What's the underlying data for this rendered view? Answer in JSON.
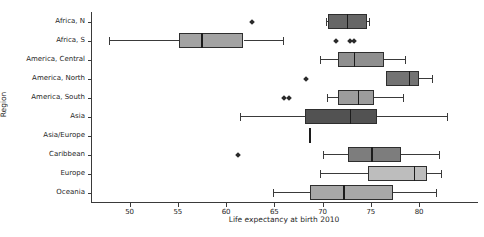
{
  "chart_data": {
    "type": "boxplot",
    "orientation": "horizontal",
    "title": "",
    "xlabel": "Life expectancy at birth 2010",
    "ylabel": "Region",
    "xlim": [
      46,
      86
    ],
    "x_ticks": [
      50,
      55,
      60,
      65,
      70,
      75,
      80
    ],
    "grid": false,
    "legend": "none",
    "categories": [
      "Africa, N",
      "Africa, S",
      "America, Central",
      "America, North",
      "America, South",
      "Asia",
      "Asia/Europe",
      "Caribbean",
      "Europe",
      "Oceania"
    ],
    "series": [
      {
        "name": "Africa, N",
        "whisker_lo": 70.2,
        "q1": 70.5,
        "median": 72.5,
        "q3": 74.5,
        "whisker_hi": 74.8,
        "fliers": [
          62.6
        ],
        "color": "#666666"
      },
      {
        "name": "Africa, S",
        "whisker_lo": 47.8,
        "q1": 55.0,
        "median": 57.4,
        "q3": 61.7,
        "whisker_hi": 65.9,
        "fliers": [
          71.3,
          72.7,
          73.2
        ],
        "color": "#a3a3a3"
      },
      {
        "name": "America, Central",
        "whisker_lo": 69.6,
        "q1": 71.5,
        "median": 73.2,
        "q3": 76.3,
        "whisker_hi": 78.5,
        "fliers": [],
        "color": "#8f8f8f"
      },
      {
        "name": "America, North",
        "whisker_lo": 76.5,
        "q1": 76.5,
        "median": 78.9,
        "q3": 79.9,
        "whisker_hi": 81.3,
        "fliers": [
          68.2
        ],
        "color": "#737373"
      },
      {
        "name": "America, South",
        "whisker_lo": 70.4,
        "q1": 71.5,
        "median": 73.6,
        "q3": 75.2,
        "whisker_hi": 78.3,
        "fliers": [
          65.9,
          66.4
        ],
        "color": "#9c9c9c"
      },
      {
        "name": "Asia",
        "whisker_lo": 61.3,
        "q1": 68.1,
        "median": 72.8,
        "q3": 75.5,
        "whisker_hi": 82.9,
        "fliers": [],
        "color": "#525252"
      },
      {
        "name": "Asia/Europe",
        "whisker_lo": 68.6,
        "q1": 68.6,
        "median": 68.6,
        "q3": 68.6,
        "whisker_hi": 68.6,
        "fliers": [],
        "color": "#808080"
      },
      {
        "name": "Caribbean",
        "whisker_lo": 69.9,
        "q1": 72.5,
        "median": 75.0,
        "q3": 78.0,
        "whisker_hi": 82.1,
        "fliers": [
          61.1
        ],
        "color": "#7d7d7d"
      },
      {
        "name": "Europe",
        "whisker_lo": 69.6,
        "q1": 74.6,
        "median": 79.4,
        "q3": 80.7,
        "whisker_hi": 82.3,
        "fliers": [],
        "color": "#bdbdbd"
      },
      {
        "name": "Oceania",
        "whisker_lo": 64.8,
        "q1": 68.6,
        "median": 72.1,
        "q3": 77.2,
        "whisker_hi": 81.7,
        "fliers": [],
        "color": "#a8a8a8"
      }
    ]
  }
}
